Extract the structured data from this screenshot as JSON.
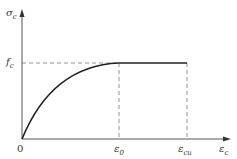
{
  "diagram": {
    "y_axis": {
      "label": "σ",
      "sub": "c"
    },
    "x_axis": {
      "label": "ε",
      "sub": "c"
    },
    "origin": "0",
    "fc_label": {
      "main": "f",
      "sub": "c"
    },
    "eps0_label": {
      "main": "ε",
      "sub": "0"
    },
    "epscu_label": {
      "main": "ε",
      "sub": "cu"
    }
  }
}
